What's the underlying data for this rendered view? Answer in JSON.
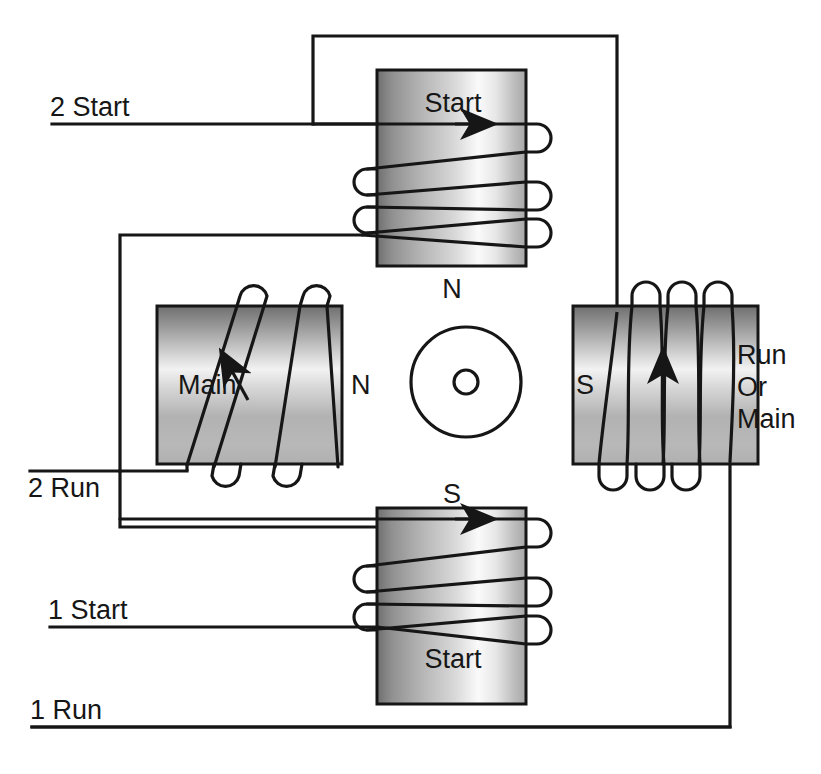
{
  "diagram": {
    "type": "electrical-winding-schematic",
    "background_color": "#ffffff",
    "line_color": "#161616",
    "pole_gradient": {
      "dark": "#6d6d6d",
      "mid": "#b9b9b9",
      "light": "#fbfbfb",
      "edge": "#8e8e8e"
    }
  },
  "terminals": [
    {
      "id": "t2start",
      "label": "2 Start",
      "x": 50,
      "y": 116
    },
    {
      "id": "t2run",
      "label": "2 Run",
      "x": 28,
      "y": 489
    },
    {
      "id": "t1start",
      "label": "1 Start",
      "x": 48,
      "y": 627
    },
    {
      "id": "t1run",
      "label": "1 Run",
      "x": 30,
      "y": 719
    }
  ],
  "poles": [
    {
      "id": "pole-top",
      "position": "top",
      "orientation": "vertical",
      "winding_label": "Start",
      "winding_label_x": 453,
      "winding_label_y": 112,
      "polarity_label": "N",
      "polarity_label_x": 452,
      "polarity_label_y": 289,
      "turns": 3,
      "rect": {
        "x": 377,
        "y": 70,
        "w": 149,
        "h": 196
      }
    },
    {
      "id": "pole-left",
      "position": "left",
      "orientation": "horizontal",
      "winding_label": "Main",
      "winding_label_x": 178,
      "winding_label_y": 385,
      "polarity_label": "N",
      "polarity_label_x": 350,
      "polarity_label_y": 385,
      "turns": 3,
      "rect": {
        "x": 157,
        "y": 306,
        "w": 185,
        "h": 158
      }
    },
    {
      "id": "pole-right",
      "position": "right",
      "orientation": "horizontal",
      "winding_label": "Run\nOr\nMain",
      "winding_label_lines": [
        "Run",
        "Or",
        "Main"
      ],
      "winding_label_x": 737,
      "winding_label_y": 358,
      "polarity_label": "S",
      "polarity_label_x": 592,
      "polarity_label_y": 385,
      "turns": 3,
      "rect": {
        "x": 573,
        "y": 306,
        "w": 185,
        "h": 158
      }
    },
    {
      "id": "pole-bottom",
      "position": "bottom",
      "orientation": "vertical",
      "winding_label": "Start",
      "winding_label_x": 453,
      "winding_label_y": 658,
      "polarity_label": "S",
      "polarity_label_x": 452,
      "polarity_label_y": 496,
      "turns": 3,
      "rect": {
        "x": 377,
        "y": 508,
        "w": 149,
        "h": 196
      }
    }
  ],
  "rotor": {
    "id": "rotor",
    "center_x": 466,
    "center_y": 382,
    "outer_radius": 55,
    "shaft_radius": 12
  },
  "wires": [
    {
      "id": "w-2start",
      "from": "2 Start",
      "to": "top pole start winding",
      "path": "M 52 124 L 495 124"
    },
    {
      "id": "w-top-loop",
      "from": "top pole outer",
      "to": "right pole top",
      "path": "M 313 124 L 313 36 L 617 36 L 617 310"
    },
    {
      "id": "w-left-link",
      "from": "top pole lower tap",
      "to": "left pole main winding",
      "path": "M 360 235 L 120 235 L 120 471"
    },
    {
      "id": "w-2run",
      "from": "2 Run",
      "to": "left pole main winding bottom",
      "path": "M 30 471 L 187 471"
    },
    {
      "id": "w-left-to-bottom",
      "from": "left pole",
      "to": "bottom pole start winding",
      "path": "M 120 527 L 495 527"
    },
    {
      "id": "w-1start",
      "from": "1 Start",
      "to": "bottom pole start winding",
      "path": "M 50 627 L 377 627"
    },
    {
      "id": "w-1run",
      "from": "1 Run",
      "to": "right pole bottom",
      "path": "M 32 727 L 730 727 L 730 460"
    }
  ],
  "arrows": [
    {
      "id": "arrow-top",
      "pole": "pole-top",
      "direction": "right",
      "x": 480,
      "y": 124
    },
    {
      "id": "arrow-left",
      "pole": "pole-left",
      "direction": "up-right",
      "x": 228,
      "y": 358
    },
    {
      "id": "arrow-right",
      "pole": "pole-right",
      "direction": "up",
      "x": 668,
      "y": 358
    },
    {
      "id": "arrow-bottom",
      "pole": "pole-bottom",
      "direction": "right",
      "x": 480,
      "y": 519
    }
  ]
}
